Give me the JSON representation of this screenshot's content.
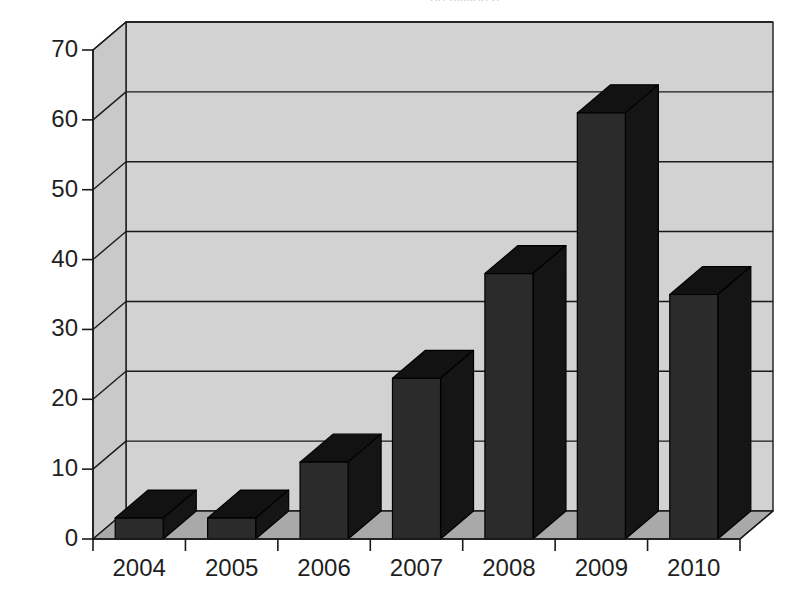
{
  "chart_data": {
    "type": "bar",
    "title": "(in millions)",
    "title_cropped": true,
    "subtitle": "",
    "xlabel": "",
    "ylabel": "",
    "categories": [
      "2004",
      "2005",
      "2006",
      "2007",
      "2008",
      "2009",
      "2010"
    ],
    "values": [
      3,
      3,
      11,
      23,
      38,
      61,
      35
    ],
    "ylim": [
      0,
      70
    ],
    "ytick_values": [
      0,
      10,
      20,
      30,
      40,
      50,
      60,
      70
    ],
    "ytick_labels": [
      "0",
      "10",
      "20",
      "30",
      "40",
      "50",
      "60",
      "70"
    ],
    "grid": true,
    "grid_axis": "y",
    "legend": null,
    "legend_position": "none",
    "style": "3d-column",
    "annotations": [],
    "series": [
      {
        "name": "series-1",
        "values": [
          3,
          3,
          11,
          23,
          38,
          61,
          35
        ]
      }
    ]
  },
  "colors": {
    "bar_front": "#2b2b2b",
    "bar_top": "#121212",
    "bar_side": "#151515",
    "back_wall": "#d2d2d2",
    "left_wall": "#c9c9c9",
    "floor": "#a9a9a9",
    "axis_line": "#1a1a1a",
    "grid_line": "#1a1a1a",
    "text": "#1f1f1f",
    "background": "#ffffff"
  },
  "axes": {
    "y_axis_name": "value-axis",
    "x_axis_name": "category-axis"
  }
}
